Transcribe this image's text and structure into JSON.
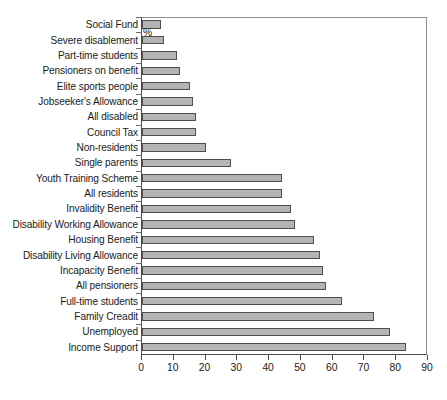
{
  "chart_data": {
    "type": "bar",
    "orientation": "horizontal",
    "title": "",
    "subtitle": "",
    "xlabel": "%",
    "ylabel": "",
    "xlim": [
      0,
      90
    ],
    "xticks": [
      0,
      10,
      20,
      30,
      40,
      50,
      60,
      70,
      80,
      90
    ],
    "xtick_labels": [
      "0",
      "10",
      "20",
      "30",
      "40",
      "50",
      "60",
      "70",
      "80",
      "90"
    ],
    "grid": false,
    "legend": null,
    "legend_position": "none",
    "bar_fill_color": "#b4b4b4",
    "bar_edge_color": "#4f4f4f",
    "axis_color": "#4a4a4a",
    "background_color": "#ffffff",
    "categories": [
      "Social Fund",
      "Severe disablement",
      "Part-time students",
      "Pensioners on benefit",
      "Elite sports people",
      "Jobseeker's Allowance",
      "All disabled",
      "Council Tax",
      "Non-residents",
      "Single parents",
      "Youth Training Scheme",
      "All residents",
      "Invalidity Benefit",
      "Disability Working Allowance",
      "Housing Benefit",
      "Disability Living Allowance",
      "Incapacity Benefit",
      "All pensioners",
      "Full-time students",
      "Family Creadit",
      "Unemployed",
      "Income Support"
    ],
    "values": [
      6,
      7,
      11,
      12,
      15,
      16,
      17,
      17,
      20,
      28,
      44,
      44,
      47,
      48,
      54,
      56,
      57,
      58,
      63,
      73,
      78,
      83
    ]
  }
}
